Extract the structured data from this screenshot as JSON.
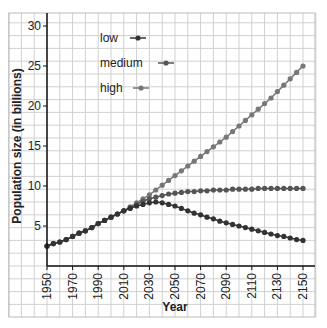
{
  "chart_data": {
    "type": "line",
    "title": "",
    "xlabel": "Year",
    "ylabel": "Population size (in billions)",
    "xlim": [
      1950,
      2150
    ],
    "ylim": [
      0,
      30
    ],
    "grid": true,
    "legend_position": "upper-left inside plot",
    "x_ticks": [
      1950,
      1970,
      1990,
      2010,
      2030,
      2050,
      2070,
      2090,
      2110,
      2130,
      2150
    ],
    "x_tick_labels": [
      "1950",
      "1970",
      "1990",
      "2010",
      "2030",
      "2050",
      "2070",
      "2090",
      "2110",
      "2130",
      "2150"
    ],
    "y_ticks": [
      5,
      10,
      15,
      20,
      25,
      30
    ],
    "y_tick_labels": [
      "5",
      "10",
      "15",
      "20",
      "25",
      "30"
    ],
    "x": [
      1950,
      1955,
      1960,
      1965,
      1970,
      1975,
      1980,
      1985,
      1990,
      1995,
      2000,
      2005,
      2010,
      2015,
      2020,
      2025,
      2030,
      2035,
      2040,
      2045,
      2050,
      2055,
      2060,
      2065,
      2070,
      2075,
      2080,
      2085,
      2090,
      2095,
      2100,
      2105,
      2110,
      2115,
      2120,
      2125,
      2130,
      2135,
      2140,
      2145,
      2150
    ],
    "series": [
      {
        "name": "low",
        "color": "#333333",
        "values": [
          2.5,
          2.8,
          3.0,
          3.3,
          3.7,
          4.1,
          4.4,
          4.8,
          5.3,
          5.7,
          6.1,
          6.5,
          6.9,
          7.2,
          7.5,
          7.7,
          7.9,
          8.0,
          7.9,
          7.7,
          7.5,
          7.2,
          6.9,
          6.6,
          6.4,
          6.1,
          5.9,
          5.6,
          5.4,
          5.2,
          5.0,
          4.8,
          4.6,
          4.4,
          4.2,
          4.0,
          3.8,
          3.7,
          3.5,
          3.3,
          3.2
        ]
      },
      {
        "name": "medium",
        "color": "#555555",
        "values": [
          2.5,
          2.8,
          3.0,
          3.3,
          3.7,
          4.1,
          4.4,
          4.8,
          5.3,
          5.7,
          6.1,
          6.5,
          6.9,
          7.3,
          7.7,
          8.1,
          8.4,
          8.6,
          8.8,
          9.0,
          9.1,
          9.2,
          9.3,
          9.3,
          9.4,
          9.4,
          9.5,
          9.5,
          9.5,
          9.6,
          9.6,
          9.6,
          9.6,
          9.7,
          9.7,
          9.7,
          9.7,
          9.7,
          9.7,
          9.7,
          9.7
        ]
      },
      {
        "name": "high",
        "color": "#777777",
        "values": [
          2.5,
          2.8,
          3.0,
          3.3,
          3.7,
          4.1,
          4.4,
          4.8,
          5.3,
          5.7,
          6.1,
          6.5,
          6.9,
          7.4,
          7.9,
          8.4,
          8.9,
          9.5,
          10.1,
          10.7,
          11.3,
          11.9,
          12.5,
          13.1,
          13.7,
          14.3,
          14.9,
          15.5,
          16.1,
          16.8,
          17.5,
          18.2,
          18.9,
          19.6,
          20.3,
          21.0,
          21.8,
          22.6,
          23.4,
          24.2,
          25.0
        ]
      }
    ]
  },
  "legend": {
    "items": [
      {
        "label": "low"
      },
      {
        "label": "medium"
      },
      {
        "label": "high"
      }
    ]
  },
  "axes": {
    "xlabel": "Year",
    "ylabel": "Population size (in billions)"
  }
}
